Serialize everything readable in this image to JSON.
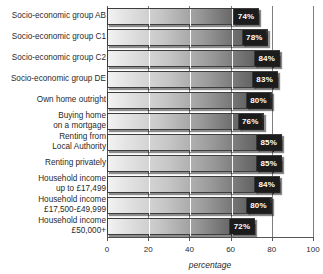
{
  "chart_data": {
    "type": "bar",
    "orientation": "horizontal",
    "title": "",
    "xlabel": "percentage",
    "ylabel": "",
    "xlim": [
      0,
      100
    ],
    "xticks": [
      0,
      20,
      40,
      60,
      80,
      100
    ],
    "grid": true,
    "legend": null,
    "value_suffix": "%",
    "categories": [
      "Socio-economic group AB",
      "Socio-economic group C1",
      "Socio-economic group C2",
      "Socio-economic group DE",
      "Own home outright",
      "Buying home\non a mortgage",
      "Renting from\nLocal Authority",
      "Renting privately",
      "Household income\nup to £17,499",
      "Household income\n£17,500-£49,999",
      "Household income\n£50,000+"
    ],
    "values": [
      74,
      78,
      84,
      83,
      80,
      76,
      85,
      85,
      84,
      80,
      72
    ],
    "value_labels": [
      "74%",
      "78%",
      "84%",
      "83%",
      "80%",
      "76%",
      "85%",
      "85%",
      "84%",
      "80%",
      "72%"
    ]
  },
  "colors": {
    "bar_light": "#f2f2f2",
    "bar_dark": "#4a4a4a",
    "badge_background": "#1c1c1c",
    "badge_text": "#ffffff",
    "axis": "#555555",
    "gridline": "#7d7d7d",
    "text": "#2a2a2a",
    "background": "#ffffff"
  }
}
